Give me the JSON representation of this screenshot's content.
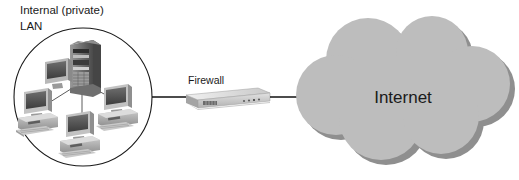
{
  "diagram": {
    "type": "network-topology",
    "background_color": "#ffffff",
    "title": "",
    "nodes": [
      {
        "id": "lan",
        "label": "Internal (private)\nLAN",
        "label_line1": "Internal (private)",
        "label_line2": "LAN",
        "shape": "circle",
        "stroke_color": "#1a1a1a",
        "fill_color": "#ffffff",
        "contains": [
          {
            "name": "tower-server",
            "type": "server"
          },
          {
            "name": "desktop-pc-left",
            "type": "workstation"
          },
          {
            "name": "desktop-pc-center",
            "type": "workstation"
          },
          {
            "name": "desktop-pc-right",
            "type": "workstation"
          }
        ]
      },
      {
        "id": "firewall",
        "label": "Firewall",
        "shape": "rack-appliance",
        "body_color": "#d4d4d4",
        "top_color": "#e8e8e8",
        "side_color": "#a8a8a8"
      },
      {
        "id": "internet",
        "label": "Internet",
        "shape": "cloud",
        "fill_color": "#bdbdbd",
        "shadow_color": "#8f8f8f",
        "text_color": "#1a1a1a"
      }
    ],
    "edges": [
      {
        "from": "lan",
        "to": "firewall",
        "style": "solid",
        "color": "#111111"
      },
      {
        "from": "firewall",
        "to": "internet",
        "style": "solid",
        "color": "#111111"
      }
    ]
  },
  "labels": {
    "lan_line1": "Internal (private)",
    "lan_line2": "LAN",
    "firewall": "Firewall",
    "internet": "Internet"
  }
}
